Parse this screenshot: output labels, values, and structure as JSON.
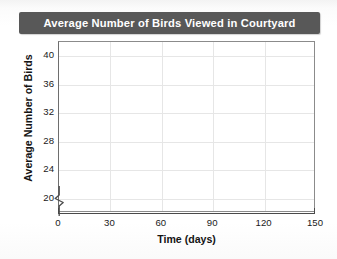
{
  "chart_data": {
    "type": "line",
    "title": "Average Number of Birds Viewed in Courtyard",
    "xlabel": "Time (days)",
    "ylabel": "Average Number of Birds",
    "x": [],
    "values": [],
    "series": [],
    "xticks": [
      0,
      30,
      60,
      90,
      120,
      150
    ],
    "xtick_labels": [
      "0",
      "30",
      "60",
      "90",
      "120",
      "150"
    ],
    "yticks": [
      20,
      24,
      28,
      32,
      36,
      40
    ],
    "ytick_labels": [
      "20",
      "24",
      "28",
      "32",
      "36",
      "40"
    ],
    "xlim": [
      0,
      150
    ],
    "ylim": [
      18,
      42
    ],
    "grid": true,
    "legend": "none",
    "y_axis_break": true
  },
  "colors": {
    "title_banner_bg": "#585858",
    "title_text": "#ffffff",
    "plot_border": "#8b8b8b",
    "gridline": "#e6e6e6",
    "axis_line": "#4a4a4a",
    "tick_text": "#1a1a1a",
    "plot_bg": "#ffffff",
    "page_bg": "#ffffff"
  }
}
